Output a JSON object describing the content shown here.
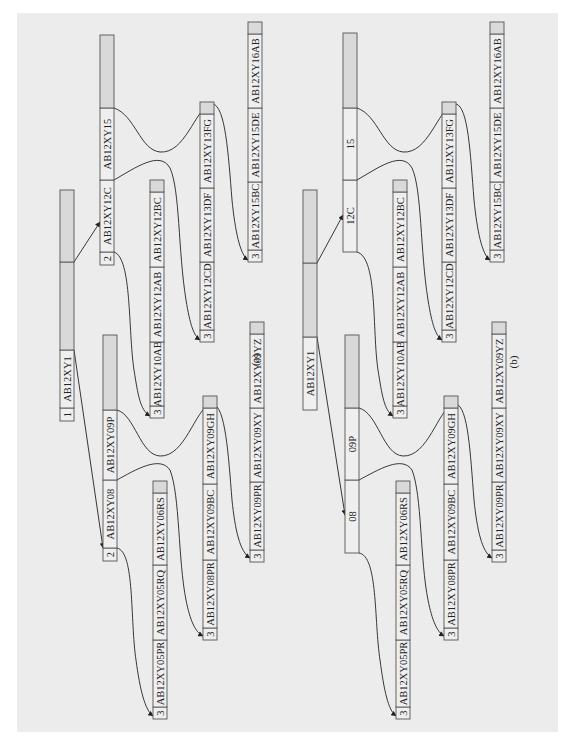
{
  "figure": {
    "background_color": "#ececec",
    "node_fill": "#d9d9d9",
    "level_cell_fill": "#efefef",
    "stroke_color": "#555555",
    "panels": [
      {
        "id": "a",
        "caption": "(a)",
        "caption_pos": [
          259,
          360
        ],
        "nodes": [
          {
            "id": "a-root",
            "x": 60,
            "w": 14,
            "cells": [
              {
                "y0": 408,
                "y1": 421,
                "text": "1",
                "kind": "level"
              },
              {
                "y0": 350,
                "y1": 408,
                "text": "AB12XY1"
              },
              {
                "y0": 262,
                "y1": 350,
                "text": ""
              },
              {
                "y0": 190,
                "y1": 262,
                "text": ""
              }
            ]
          },
          {
            "id": "a-l2-top",
            "x": 100,
            "w": 14,
            "cells": [
              {
                "y0": 252,
                "y1": 265,
                "text": "2",
                "kind": "level"
              },
              {
                "y0": 180,
                "y1": 252,
                "text": "AB12XY12C"
              },
              {
                "y0": 108,
                "y1": 180,
                "text": "AB12XY15"
              },
              {
                "y0": 35,
                "y1": 108,
                "text": ""
              }
            ]
          },
          {
            "id": "a-l2-bottom",
            "x": 103,
            "w": 14,
            "cells": [
              {
                "y0": 548,
                "y1": 561,
                "text": "2",
                "kind": "level"
              },
              {
                "y0": 480,
                "y1": 548,
                "text": "AB12XY08"
              },
              {
                "y0": 410,
                "y1": 480,
                "text": "AB12XY09P"
              },
              {
                "y0": 335,
                "y1": 410,
                "text": ""
              }
            ]
          },
          {
            "id": "a-l3-10ab",
            "x": 150,
            "w": 14,
            "cells": [
              {
                "y0": 406,
                "y1": 418,
                "text": "3",
                "kind": "level"
              },
              {
                "y0": 342,
                "y1": 406,
                "text": "AB12XY10AB"
              },
              {
                "y0": 267,
                "y1": 342,
                "text": "AB12XY12AB"
              },
              {
                "y0": 192,
                "y1": 267,
                "text": "AB12XY12BC"
              },
              {
                "y0": 180,
                "y1": 192,
                "text": ""
              }
            ]
          },
          {
            "id": "a-l3-05pr",
            "x": 153,
            "w": 14,
            "cells": [
              {
                "y0": 707,
                "y1": 719,
                "text": "3",
                "kind": "level"
              },
              {
                "y0": 640,
                "y1": 707,
                "text": "AB12XY05PR"
              },
              {
                "y0": 565,
                "y1": 640,
                "text": "AB12XY05RQ"
              },
              {
                "y0": 493,
                "y1": 565,
                "text": "AB12XY06RS"
              },
              {
                "y0": 481,
                "y1": 493,
                "text": ""
              }
            ]
          },
          {
            "id": "a-l3-12cd",
            "x": 200,
            "w": 14,
            "cells": [
              {
                "y0": 330,
                "y1": 342,
                "text": "3",
                "kind": "level"
              },
              {
                "y0": 262,
                "y1": 330,
                "text": "AB12XY12CD"
              },
              {
                "y0": 188,
                "y1": 262,
                "text": "AB12XY13DF"
              },
              {
                "y0": 114,
                "y1": 188,
                "text": "AB12XY13FG"
              },
              {
                "y0": 102,
                "y1": 114,
                "text": ""
              }
            ]
          },
          {
            "id": "a-l3-08pr",
            "x": 203,
            "w": 14,
            "cells": [
              {
                "y0": 628,
                "y1": 640,
                "text": "3",
                "kind": "level"
              },
              {
                "y0": 560,
                "y1": 628,
                "text": "AB12XY08PR"
              },
              {
                "y0": 484,
                "y1": 560,
                "text": "AB12XY09BC"
              },
              {
                "y0": 408,
                "y1": 484,
                "text": "AB12XY09GH"
              },
              {
                "y0": 396,
                "y1": 408,
                "text": ""
              }
            ]
          },
          {
            "id": "a-l3-15bc",
            "x": 248,
            "w": 14,
            "cells": [
              {
                "y0": 250,
                "y1": 262,
                "text": "3",
                "kind": "level"
              },
              {
                "y0": 182,
                "y1": 250,
                "text": "AB12XY15BC"
              },
              {
                "y0": 108,
                "y1": 182,
                "text": "AB12XY15DE"
              },
              {
                "y0": 34,
                "y1": 108,
                "text": "AB12XY16AB"
              },
              {
                "y0": 22,
                "y1": 34,
                "text": ""
              }
            ]
          },
          {
            "id": "a-l3-09pr",
            "x": 250,
            "w": 14,
            "cells": [
              {
                "y0": 550,
                "y1": 562,
                "text": "3",
                "kind": "level"
              },
              {
                "y0": 482,
                "y1": 550,
                "text": "AB12XY09PR"
              },
              {
                "y0": 408,
                "y1": 482,
                "text": "AB12XY09XY"
              },
              {
                "y0": 334,
                "y1": 408,
                "text": "AB12XY09YZ"
              },
              {
                "y0": 322,
                "y1": 334,
                "text": ""
              }
            ]
          }
        ],
        "links": [
          {
            "from": "a-root",
            "d": "M74,350 L103,548"
          },
          {
            "from": "a-root",
            "d": "M74,262 L100,222"
          },
          {
            "from": "a-l2-top",
            "d": "M114,252 C132,258 128,330 134,370 C138,395 140,410 150,416"
          },
          {
            "from": "a-l2-top",
            "d": "M114,180 C135,168 160,150 170,168 C180,190 178,250 186,300 C190,325 194,336 200,340"
          },
          {
            "from": "a-l2-top",
            "d": "M114,108 C135,115 140,150 160,152 C185,154 195,110 210,104 C225,100 228,150 232,200 C235,230 240,255 248,260"
          },
          {
            "from": "a-l2-bottom",
            "d": "M117,548 C135,552 130,620 136,660 C140,690 145,710 153,716"
          },
          {
            "from": "a-l2-bottom",
            "d": "M117,480 C135,470 160,455 170,470 C180,495 178,560 186,600 C190,620 195,632 203,636"
          },
          {
            "from": "a-l2-bottom",
            "d": "M117,410 C135,415 140,455 160,456 C185,457 195,410 210,404 C225,400 228,450 232,500 C235,530 240,552 250,558"
          }
        ]
      },
      {
        "id": "b",
        "caption": "(b)",
        "caption_pos": [
          517,
          362
        ],
        "nodes": [
          {
            "id": "b-root",
            "x": 303,
            "w": 14,
            "cells": [
              {
                "y0": 337,
                "y1": 410,
                "text": "AB12XY1"
              },
              {
                "y0": 263,
                "y1": 337,
                "text": ""
              },
              {
                "y0": 190,
                "y1": 263,
                "text": ""
              }
            ]
          },
          {
            "id": "b-l2-top",
            "x": 343,
            "w": 14,
            "cells": [
              {
                "y0": 180,
                "y1": 252,
                "text": "12C"
              },
              {
                "y0": 108,
                "y1": 180,
                "text": "15"
              },
              {
                "y0": 33,
                "y1": 108,
                "text": ""
              }
            ]
          },
          {
            "id": "b-l2-bottom",
            "x": 345,
            "w": 14,
            "cells": [
              {
                "y0": 480,
                "y1": 553,
                "text": "08"
              },
              {
                "y0": 408,
                "y1": 480,
                "text": "09P"
              },
              {
                "y0": 335,
                "y1": 408,
                "text": ""
              }
            ]
          },
          {
            "id": "b-l3-10ab",
            "x": 393,
            "w": 14,
            "cells": [
              {
                "y0": 406,
                "y1": 418,
                "text": "3",
                "kind": "level"
              },
              {
                "y0": 342,
                "y1": 406,
                "text": "AB12XY10AB"
              },
              {
                "y0": 267,
                "y1": 342,
                "text": "AB12XY12AB"
              },
              {
                "y0": 192,
                "y1": 267,
                "text": "AB12XY12BC"
              },
              {
                "y0": 180,
                "y1": 192,
                "text": ""
              }
            ]
          },
          {
            "id": "b-l3-05pr",
            "x": 396,
            "w": 14,
            "cells": [
              {
                "y0": 707,
                "y1": 719,
                "text": "3",
                "kind": "level"
              },
              {
                "y0": 640,
                "y1": 707,
                "text": "AB12XY05PR"
              },
              {
                "y0": 565,
                "y1": 640,
                "text": "AB12XY05RQ"
              },
              {
                "y0": 493,
                "y1": 565,
                "text": "AB12XY06RS"
              },
              {
                "y0": 481,
                "y1": 493,
                "text": ""
              }
            ]
          },
          {
            "id": "b-l3-12cd",
            "x": 442,
            "w": 14,
            "cells": [
              {
                "y0": 330,
                "y1": 342,
                "text": "3",
                "kind": "level"
              },
              {
                "y0": 262,
                "y1": 330,
                "text": "AB12XY12CD"
              },
              {
                "y0": 188,
                "y1": 262,
                "text": "AB12XY13DF"
              },
              {
                "y0": 114,
                "y1": 188,
                "text": "AB12XY13FG"
              },
              {
                "y0": 102,
                "y1": 114,
                "text": ""
              }
            ]
          },
          {
            "id": "b-l3-08pr",
            "x": 444,
            "w": 14,
            "cells": [
              {
                "y0": 628,
                "y1": 640,
                "text": "3",
                "kind": "level"
              },
              {
                "y0": 560,
                "y1": 628,
                "text": "AB12XY08PR"
              },
              {
                "y0": 484,
                "y1": 560,
                "text": "AB12XY09BC"
              },
              {
                "y0": 408,
                "y1": 484,
                "text": "AB12XY09GH"
              },
              {
                "y0": 396,
                "y1": 408,
                "text": ""
              }
            ]
          },
          {
            "id": "b-l3-15bc",
            "x": 490,
            "w": 14,
            "cells": [
              {
                "y0": 250,
                "y1": 262,
                "text": "3",
                "kind": "level"
              },
              {
                "y0": 182,
                "y1": 250,
                "text": "AB12XY15BC"
              },
              {
                "y0": 108,
                "y1": 182,
                "text": "AB12XY15DE"
              },
              {
                "y0": 34,
                "y1": 108,
                "text": "AB12XY16AB"
              },
              {
                "y0": 22,
                "y1": 34,
                "text": ""
              }
            ]
          },
          {
            "id": "b-l3-09pr",
            "x": 492,
            "w": 14,
            "cells": [
              {
                "y0": 550,
                "y1": 562,
                "text": "3",
                "kind": "level"
              },
              {
                "y0": 482,
                "y1": 550,
                "text": "AB12XY09PR"
              },
              {
                "y0": 408,
                "y1": 482,
                "text": "AB12XY09XY"
              },
              {
                "y0": 334,
                "y1": 408,
                "text": "AB12XY09YZ"
              },
              {
                "y0": 322,
                "y1": 334,
                "text": ""
              }
            ]
          }
        ],
        "links": [
          {
            "from": "b-root",
            "d": "M317,337 L345,515"
          },
          {
            "from": "b-root",
            "d": "M317,263 L343,215"
          },
          {
            "from": "b-l2-top",
            "d": "M357,252 C378,258 372,330 378,370 C382,395 384,410 393,416"
          },
          {
            "from": "b-l2-top",
            "d": "M357,180 C378,168 402,150 412,168 C422,190 420,250 428,300 C432,325 436,336 442,340"
          },
          {
            "from": "b-l2-top",
            "d": "M357,108 C378,115 383,150 403,152 C428,154 438,110 453,104 C468,100 470,150 474,200 C477,230 482,255 490,260"
          },
          {
            "from": "b-l2-bottom",
            "d": "M359,553 C378,556 374,620 380,660 C384,690 388,710 396,716"
          },
          {
            "from": "b-l2-bottom",
            "d": "M359,480 C378,470 402,455 412,470 C422,495 420,560 428,600 C432,620 437,632 444,636"
          },
          {
            "from": "b-l2-bottom",
            "d": "M359,408 C378,413 383,455 403,456 C428,457 438,410 453,404 C468,400 470,450 474,500 C477,530 482,552 492,558"
          }
        ]
      }
    ]
  }
}
